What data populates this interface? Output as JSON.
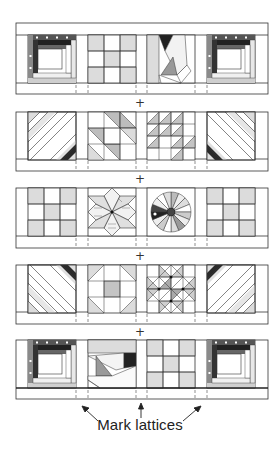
{
  "diagram": {
    "join_symbol": "+",
    "caption": "Mark lattices",
    "colors": {
      "outline": "#333333",
      "light_fill": "#dcdcdc",
      "mid_fill": "#a9a9a9",
      "dark_fill": "#2a2a2a",
      "background": "#ffffff"
    },
    "rows": [
      {
        "index": 1,
        "blocks": [
          "log-cabin",
          "nine-patch",
          "crazy-patch",
          "log-cabin"
        ]
      },
      {
        "index": 2,
        "blocks": [
          "diagonal-strips",
          "shoo-fly-triangles",
          "triangle-grid",
          "diagonal-strips-mirrored"
        ]
      },
      {
        "index": 3,
        "blocks": [
          "nine-patch",
          "eight-point-star",
          "dresden-plate",
          "nine-patch"
        ]
      },
      {
        "index": 4,
        "blocks": [
          "diagonal-strips",
          "shoo-fly",
          "pinwheel-star",
          "diagonal-strips-mirrored"
        ]
      },
      {
        "index": 5,
        "blocks": [
          "log-cabin",
          "crazy-patch",
          "nine-patch",
          "log-cabin"
        ]
      }
    ],
    "arrows": [
      "left-arrow",
      "up-arrow",
      "right-arrow"
    ]
  }
}
